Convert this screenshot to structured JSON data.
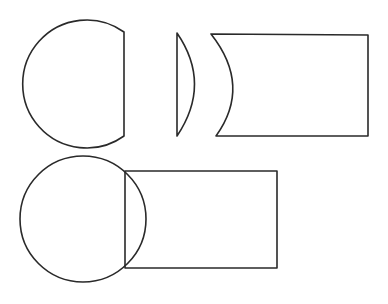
{
  "diagram": {
    "stroke_color": "#2a2a2a",
    "background_color": "#ffffff",
    "shapes": [
      {
        "id": "truncated-circle",
        "label": "Circle minus segment",
        "center": [
          87,
          84
        ],
        "radius": 64,
        "chord_x": 124
      },
      {
        "id": "circular-segment",
        "label": "Circular segment (lens)",
        "chord_x": 177,
        "top": [
          177,
          33
        ],
        "bottom": [
          177,
          136
        ],
        "bulge_x": 202
      },
      {
        "id": "notched-rectangle",
        "label": "Rectangle with concave arc",
        "top_left": [
          211,
          34
        ],
        "bottom_left": [
          216,
          136
        ],
        "right": 368,
        "arc_apex_x": 239
      },
      {
        "id": "circle-rectangle-overlap",
        "label": "Circle overlapping rectangle",
        "circle_center": [
          83,
          219
        ],
        "circle_radius": 63,
        "rect": {
          "x": 125,
          "y": 171,
          "width": 152,
          "height": 97
        }
      }
    ]
  }
}
